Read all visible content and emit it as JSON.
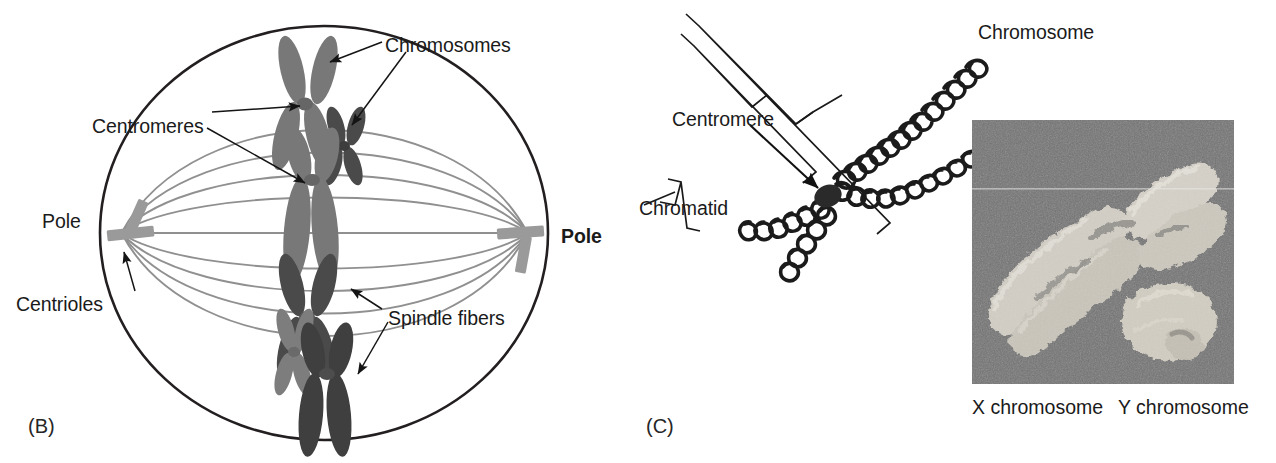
{
  "figure": {
    "background_color": "#ffffff"
  },
  "panel_b": {
    "tag": "(B)",
    "description": "Cell in metaphase showing spindle apparatus, centrioles at poles, and chromosomes aligned at the equator",
    "colors": {
      "cell_membrane": "#231f20",
      "spindle_fiber": "#8c8c8c",
      "chromosome_light": "#7a7a7a",
      "chromosome_dark": "#4a4a4a",
      "centriole": "#9a9a9a",
      "leader_line": "#1a1a1a",
      "text": "#1a1a1a"
    },
    "labels": [
      {
        "id": "chromosomes",
        "text": "Chromosomes",
        "bold": false,
        "x": 385,
        "y": 36
      },
      {
        "id": "centromeres",
        "text": "Centromeres",
        "bold": false,
        "x": 92,
        "y": 117
      },
      {
        "id": "pole_left",
        "text": "Pole",
        "bold": false,
        "x": 42,
        "y": 212
      },
      {
        "id": "centrioles",
        "text": "Centrioles",
        "bold": false,
        "x": 16,
        "y": 295
      },
      {
        "id": "pole_right",
        "text": "Pole",
        "bold": true,
        "x": 561,
        "y": 227
      },
      {
        "id": "spindle_fibers",
        "text": "Spindle fibers",
        "bold": false,
        "x": 388,
        "y": 309
      }
    ],
    "cell": {
      "center_x": 324,
      "center_y": 233,
      "radius_x": 224,
      "radius_y": 207
    },
    "chromosome_count": 8,
    "spindle_fiber_count": 9,
    "centriole_count": 2
  },
  "panel_c": {
    "tag": "(C)",
    "description": "Diagram of a duplicated chromosome made of two coiled chromatids joined at a centromere, beside an electron micrograph of human X and Y chromosomes",
    "colors": {
      "coil_stroke": "#1b1b1b",
      "centromere": "#2a2a2a",
      "bracket": "#1a1a1a",
      "arrow": "#111111",
      "text": "#1a1a1a",
      "micrograph_background": "#6d6d6d",
      "micrograph_chromosome": "#d6d6d0"
    },
    "labels": [
      {
        "id": "chromosome",
        "text": "Chromosome",
        "x": 978,
        "y": 23
      },
      {
        "id": "centromere",
        "text": "Centromere",
        "x": 672,
        "y": 110
      },
      {
        "id": "chromatid",
        "text": "Chromatid",
        "x": 639,
        "y": 199
      }
    ],
    "micrograph": {
      "x": 972,
      "y": 120,
      "width": 262,
      "height": 264,
      "caption_x": {
        "text": "X chromosome",
        "x": 972,
        "y": 396
      },
      "caption_y": {
        "text": "Y chromosome",
        "x": 1118,
        "y": 396
      }
    },
    "chromatid_count": 2
  }
}
